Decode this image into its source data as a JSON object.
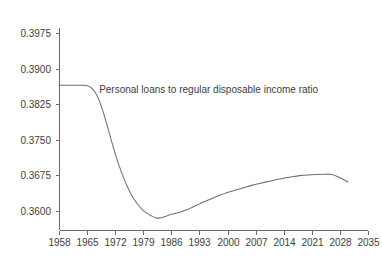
{
  "chart_data": {
    "type": "line",
    "title": "",
    "subtitle": "",
    "xlabel": "",
    "ylabel": "",
    "grid": false,
    "legend_position": "none",
    "annotations": [
      {
        "name": "series-annotation",
        "text": "Personal loans to regular disposable income ratio",
        "x": 1968,
        "y": 0.3857
      }
    ],
    "xlim": [
      1958,
      2035
    ],
    "ylim": [
      0.3563,
      0.3994
    ],
    "xticks": [
      1958,
      1965,
      1972,
      1979,
      1986,
      1993,
      2000,
      2007,
      2014,
      2021,
      2028,
      2035
    ],
    "xtick_labels": [
      "1958",
      "1965",
      "1972",
      "1979",
      "1986",
      "1993",
      "2000",
      "2007",
      "2014",
      "2021",
      "2028",
      "2035"
    ],
    "yticks": [
      0.36,
      0.3675,
      0.375,
      0.3825,
      0.39,
      0.3975
    ],
    "ytick_labels": [
      "0.3600",
      "0.3675",
      "0.3750",
      "0.3825",
      "0.3900",
      "0.3975"
    ],
    "line_color": "#6e6e6e",
    "axis_color": "#6b6b6b",
    "text_color": "#3d3d3d",
    "background_color": "#ffffff",
    "series": [
      {
        "name": "Personal loans to regular disposable income ratio",
        "x": [
          1958,
          1960,
          1962,
          1964,
          1965,
          1966,
          1967,
          1968,
          1969,
          1970,
          1971,
          1972,
          1973,
          1974,
          1975,
          1976,
          1977,
          1978,
          1979,
          1980,
          1981,
          1982,
          1983,
          1984,
          1985,
          1986,
          1987,
          1988,
          1989,
          1990,
          1991,
          1992,
          1993,
          1994,
          1996,
          1998,
          2000,
          2002,
          2004,
          2006,
          2008,
          2010,
          2012,
          2014,
          2016,
          2018,
          2020,
          2022,
          2024,
          2026,
          2028,
          2030
        ],
        "values": [
          0.3865,
          0.3865,
          0.3865,
          0.38648,
          0.3864,
          0.386,
          0.385,
          0.3833,
          0.3809,
          0.378,
          0.375,
          0.3721,
          0.3695,
          0.3672,
          0.3652,
          0.3635,
          0.3621,
          0.361,
          0.3601,
          0.3595,
          0.359,
          0.3586,
          0.3585,
          0.3587,
          0.359,
          0.3593,
          0.3595,
          0.3597,
          0.36,
          0.3603,
          0.3607,
          0.3611,
          0.3615,
          0.3619,
          0.3626,
          0.3633,
          0.3639,
          0.3644,
          0.3649,
          0.3654,
          0.3658,
          0.3662,
          0.3666,
          0.3669,
          0.3672,
          0.36745,
          0.3676,
          0.3677,
          0.36775,
          0.3677,
          0.367,
          0.3661
        ]
      }
    ]
  }
}
